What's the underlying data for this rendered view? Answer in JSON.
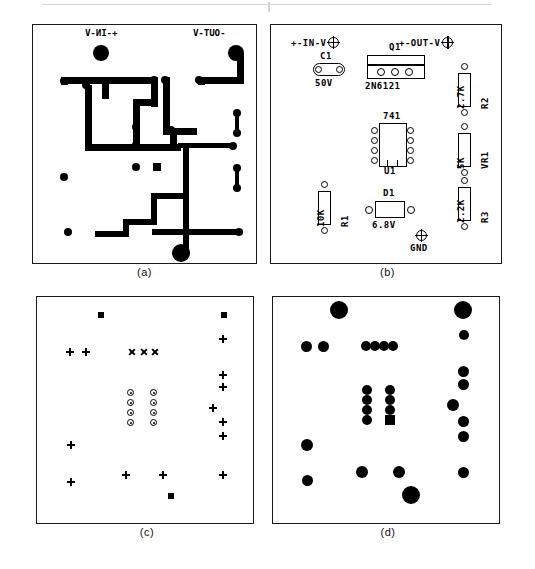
{
  "figure": {
    "panels": [
      {
        "key": "a",
        "caption": "(a)",
        "description": "copper trace layout (mirrored)"
      },
      {
        "key": "b",
        "caption": "(b)",
        "description": "component placement silkscreen"
      },
      {
        "key": "c",
        "caption": "(c)",
        "description": "drill plan"
      },
      {
        "key": "d",
        "caption": "(d)",
        "description": "solder pad master"
      }
    ]
  },
  "panel_a": {
    "caption": "(a)",
    "labels": {
      "input": "+-IN-V",
      "output": "-OUT-V",
      "ground": "GND"
    },
    "mirrored": "true",
    "traces": [
      {
        "x": 69,
        "y": 52,
        "w": 7,
        "h": 22
      },
      {
        "x": 28,
        "y": 52,
        "w": 48,
        "h": 7
      },
      {
        "x": 28,
        "y": 52,
        "w": 7,
        "h": 8
      },
      {
        "x": 69,
        "y": 52,
        "w": 56,
        "h": 7
      },
      {
        "x": 118,
        "y": 52,
        "w": 7,
        "h": 30
      },
      {
        "x": 100,
        "y": 74,
        "w": 25,
        "h": 7
      },
      {
        "x": 100,
        "y": 74,
        "w": 7,
        "h": 52
      },
      {
        "x": 100,
        "y": 119,
        "w": 48,
        "h": 7
      },
      {
        "x": 52,
        "y": 60,
        "w": 7,
        "h": 66
      },
      {
        "x": 52,
        "y": 119,
        "w": 54,
        "h": 7
      },
      {
        "x": 130,
        "y": 52,
        "w": 7,
        "h": 58
      },
      {
        "x": 130,
        "y": 103,
        "w": 34,
        "h": 7
      },
      {
        "x": 137,
        "y": 110,
        "w": 7,
        "h": 16
      },
      {
        "x": 145,
        "y": 118,
        "w": 58,
        "h": 5
      },
      {
        "x": 150,
        "y": 123,
        "w": 6,
        "h": 50
      },
      {
        "x": 118,
        "y": 168,
        "w": 38,
        "h": 6
      },
      {
        "x": 118,
        "y": 168,
        "w": 6,
        "h": 32
      },
      {
        "x": 90,
        "y": 194,
        "w": 34,
        "h": 6
      },
      {
        "x": 90,
        "y": 194,
        "w": 6,
        "h": 18
      },
      {
        "x": 62,
        "y": 206,
        "w": 34,
        "h": 6
      },
      {
        "x": 150,
        "y": 168,
        "w": 6,
        "h": 62
      },
      {
        "x": 119,
        "y": 204,
        "w": 90,
        "h": 6
      },
      {
        "x": 165,
        "y": 52,
        "w": 7,
        "h": 8
      },
      {
        "x": 165,
        "y": 52,
        "w": 46,
        "h": 7
      },
      {
        "x": 204,
        "y": 29,
        "w": 7,
        "h": 28
      }
    ],
    "pads": [
      {
        "x": 68,
        "y": 28,
        "r": 8,
        "shape": "circle"
      },
      {
        "x": 203,
        "y": 28,
        "r": 8,
        "shape": "circle"
      },
      {
        "x": 148,
        "y": 228,
        "r": 9,
        "shape": "circle"
      },
      {
        "x": 31,
        "y": 56,
        "r": 4,
        "shape": "circle"
      },
      {
        "x": 53,
        "y": 60,
        "r": 4,
        "shape": "circle"
      },
      {
        "x": 31,
        "y": 152,
        "r": 4,
        "shape": "circle"
      },
      {
        "x": 121,
        "y": 55,
        "r": 4,
        "shape": "circle"
      },
      {
        "x": 132,
        "y": 55,
        "r": 4,
        "shape": "circle"
      },
      {
        "x": 166,
        "y": 55,
        "r": 4,
        "shape": "circle"
      },
      {
        "x": 103,
        "y": 120,
        "r": 4,
        "shape": "circle"
      },
      {
        "x": 103,
        "y": 102,
        "r": 4,
        "shape": "circle"
      },
      {
        "x": 138,
        "y": 105,
        "r": 4,
        "shape": "circle"
      },
      {
        "x": 103,
        "y": 142,
        "r": 4,
        "shape": "circle"
      },
      {
        "x": 124,
        "y": 142,
        "r": 4,
        "shape": "square"
      },
      {
        "x": 200,
        "y": 121,
        "r": 4,
        "shape": "circle"
      },
      {
        "x": 206,
        "y": 207,
        "r": 4,
        "shape": "circle"
      },
      {
        "x": 35,
        "y": 207,
        "r": 4,
        "shape": "circle"
      },
      {
        "x": 204,
        "y": 88,
        "r": 4,
        "shape": "circle"
      },
      {
        "x": 204,
        "y": 108,
        "r": 4,
        "shape": "circle"
      },
      {
        "x": 204,
        "y": 143,
        "r": 4,
        "shape": "circle"
      },
      {
        "x": 204,
        "y": 163,
        "r": 4,
        "shape": "circle"
      }
    ],
    "links": [
      {
        "x": 202,
        "y": 88,
        "w": 4,
        "h": 22
      },
      {
        "x": 202,
        "y": 143,
        "w": 4,
        "h": 22
      }
    ]
  },
  "panel_b": {
    "caption": "(b)",
    "connectors": [
      {
        "name": "input",
        "label": "+-IN-V",
        "x": 20,
        "y": 14
      },
      {
        "name": "output",
        "label": "+-OUT-V",
        "x": 128,
        "y": 14
      },
      {
        "name": "ground",
        "label": "GND",
        "x": 135,
        "y": 205
      }
    ],
    "components": [
      {
        "ref": "C1",
        "value": "50V",
        "type": "capacitor",
        "x": 42,
        "y": 38
      },
      {
        "ref": "Q1",
        "value": "2N6121",
        "type": "transistor",
        "x": 96,
        "y": 30
      },
      {
        "ref": "U1",
        "value": "741",
        "type": "dip8",
        "x": 104,
        "y": 98
      },
      {
        "ref": "R1",
        "value": "10K",
        "type": "resistor",
        "x": 38,
        "y": 156
      },
      {
        "ref": "D1",
        "value": "6.8V",
        "type": "diode",
        "x": 98,
        "y": 176
      },
      {
        "ref": "R2",
        "value": "2.7K",
        "type": "resistor",
        "x": 178,
        "y": 38
      },
      {
        "ref": "VR1",
        "value": "5K",
        "type": "pot",
        "x": 178,
        "y": 98
      },
      {
        "ref": "R3",
        "value": "2.2K",
        "type": "resistor",
        "x": 178,
        "y": 152
      }
    ]
  },
  "panel_c": {
    "caption": "(c)",
    "legend": [
      "plus",
      "ex",
      "ring",
      "square"
    ],
    "holes": [
      {
        "sym": "square",
        "x": 61,
        "y": 15,
        "s": 6
      },
      {
        "sym": "square",
        "x": 184,
        "y": 15,
        "s": 6
      },
      {
        "sym": "plus",
        "x": 29,
        "y": 51,
        "s": 8
      },
      {
        "sym": "plus",
        "x": 45,
        "y": 51,
        "s": 8
      },
      {
        "sym": "ex",
        "x": 91,
        "y": 51,
        "s": 8
      },
      {
        "sym": "ex",
        "x": 103,
        "y": 51,
        "s": 8
      },
      {
        "sym": "ex",
        "x": 114,
        "y": 51,
        "s": 8
      },
      {
        "sym": "plus",
        "x": 182,
        "y": 38,
        "s": 8
      },
      {
        "sym": "plus",
        "x": 182,
        "y": 74,
        "s": 8
      },
      {
        "sym": "plus",
        "x": 182,
        "y": 86,
        "s": 8
      },
      {
        "sym": "plus",
        "x": 172,
        "y": 107,
        "s": 8
      },
      {
        "sym": "plus",
        "x": 182,
        "y": 121,
        "s": 8
      },
      {
        "sym": "plus",
        "x": 182,
        "y": 135,
        "s": 8
      },
      {
        "sym": "plus",
        "x": 182,
        "y": 174,
        "s": 8
      },
      {
        "sym": "plus",
        "x": 30,
        "y": 144,
        "s": 8
      },
      {
        "sym": "plus",
        "x": 30,
        "y": 181,
        "s": 8
      },
      {
        "sym": "plus",
        "x": 85,
        "y": 174,
        "s": 8
      },
      {
        "sym": "plus",
        "x": 122,
        "y": 174,
        "s": 8
      },
      {
        "sym": "square",
        "x": 131,
        "y": 196,
        "s": 6
      },
      {
        "sym": "ring",
        "x": 90,
        "y": 92,
        "s": 7
      },
      {
        "sym": "ring",
        "x": 90,
        "y": 102,
        "s": 7
      },
      {
        "sym": "ring",
        "x": 90,
        "y": 112,
        "s": 7
      },
      {
        "sym": "ring",
        "x": 90,
        "y": 122,
        "s": 7
      },
      {
        "sym": "ring",
        "x": 113,
        "y": 92,
        "s": 7
      },
      {
        "sym": "ring",
        "x": 113,
        "y": 102,
        "s": 7
      },
      {
        "sym": "ring",
        "x": 113,
        "y": 112,
        "s": 7
      },
      {
        "sym": "ring",
        "x": 113,
        "y": 122,
        "s": 7
      }
    ]
  },
  "panel_d": {
    "caption": "(d)",
    "pads": [
      {
        "x": 66,
        "y": 13,
        "r": 9,
        "shape": "circle"
      },
      {
        "x": 190,
        "y": 13,
        "r": 9,
        "shape": "circle"
      },
      {
        "x": 191,
        "y": 38,
        "r": 5,
        "shape": "circle"
      },
      {
        "x": 33,
        "y": 49,
        "r": 5.5,
        "shape": "circle"
      },
      {
        "x": 50,
        "y": 49,
        "r": 5.5,
        "shape": "circle"
      },
      {
        "x": 93,
        "y": 49,
        "r": 5,
        "shape": "circle"
      },
      {
        "x": 102,
        "y": 49,
        "r": 5,
        "shape": "circle"
      },
      {
        "x": 111,
        "y": 49,
        "r": 5,
        "shape": "circle"
      },
      {
        "x": 120,
        "y": 49,
        "r": 5,
        "shape": "circle"
      },
      {
        "x": 190,
        "y": 74,
        "r": 5.5,
        "shape": "circle"
      },
      {
        "x": 190,
        "y": 87,
        "r": 5.5,
        "shape": "circle"
      },
      {
        "x": 180,
        "y": 108,
        "r": 6,
        "shape": "circle"
      },
      {
        "x": 190,
        "y": 124,
        "r": 5.5,
        "shape": "circle"
      },
      {
        "x": 190,
        "y": 139,
        "r": 5.5,
        "shape": "circle"
      },
      {
        "x": 190,
        "y": 175,
        "r": 5.5,
        "shape": "circle"
      },
      {
        "x": 34,
        "y": 148,
        "r": 6,
        "shape": "circle"
      },
      {
        "x": 34,
        "y": 183,
        "r": 5.5,
        "shape": "circle"
      },
      {
        "x": 89,
        "y": 175,
        "r": 6,
        "shape": "circle"
      },
      {
        "x": 126,
        "y": 175,
        "r": 6,
        "shape": "circle"
      },
      {
        "x": 138,
        "y": 198,
        "r": 9,
        "shape": "circle"
      },
      {
        "x": 94,
        "y": 93,
        "r": 5,
        "shape": "circle"
      },
      {
        "x": 94,
        "y": 103,
        "r": 5,
        "shape": "circle"
      },
      {
        "x": 94,
        "y": 113,
        "r": 5,
        "shape": "circle"
      },
      {
        "x": 94,
        "y": 123,
        "r": 5,
        "shape": "circle"
      },
      {
        "x": 117,
        "y": 93,
        "r": 5,
        "shape": "circle"
      },
      {
        "x": 117,
        "y": 103,
        "r": 5,
        "shape": "circle"
      },
      {
        "x": 117,
        "y": 113,
        "r": 5,
        "shape": "circle"
      },
      {
        "x": 117,
        "y": 123,
        "r": 5,
        "shape": "square"
      }
    ]
  }
}
